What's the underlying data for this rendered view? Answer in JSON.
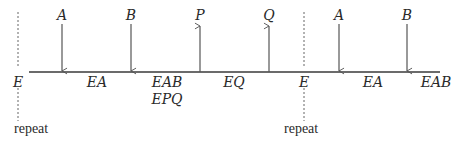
{
  "diagram": {
    "timeline": {
      "y": 72,
      "x_start": 29,
      "x_end": 440,
      "color": "#3a3a3a"
    },
    "repeat_markers": [
      {
        "x": 18,
        "label": "E",
        "note": "repeat"
      },
      {
        "x": 304,
        "label": "E",
        "note": "repeat"
      }
    ],
    "arrows": [
      {
        "x": 62,
        "label": "A",
        "direction": "down"
      },
      {
        "x": 131,
        "label": "B",
        "direction": "down"
      },
      {
        "x": 200,
        "label": "P",
        "direction": "up"
      },
      {
        "x": 269,
        "label": "Q",
        "direction": "up"
      },
      {
        "x": 339,
        "label": "A",
        "direction": "down"
      },
      {
        "x": 407,
        "label": "B",
        "direction": "down"
      }
    ],
    "state_labels": [
      {
        "x": 97,
        "text": "EA"
      },
      {
        "x": 167,
        "text": "EAB"
      },
      {
        "x": 167,
        "text": "EPQ",
        "row": 2
      },
      {
        "x": 234,
        "text": "EQ"
      },
      {
        "x": 373,
        "text": "EA"
      },
      {
        "x": 438,
        "text": "EAB"
      }
    ],
    "colors": {
      "line": "#3a3a3a",
      "arrow": "#555555",
      "text": "#2a2a2a",
      "dashed": "#666666"
    }
  }
}
